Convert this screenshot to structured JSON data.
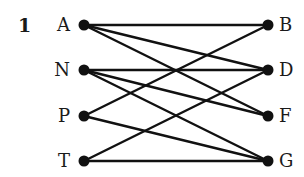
{
  "question_number": "1",
  "colors": {
    "ink": "#111111",
    "background": "#ffffff"
  },
  "left_nodes": [
    {
      "id": "A",
      "label": "A",
      "x": 84,
      "y": 25
    },
    {
      "id": "N",
      "label": "N",
      "x": 84,
      "y": 70
    },
    {
      "id": "P",
      "label": "P",
      "x": 84,
      "y": 116
    },
    {
      "id": "T",
      "label": "T",
      "x": 84,
      "y": 161
    }
  ],
  "right_nodes": [
    {
      "id": "B",
      "label": "B",
      "x": 268,
      "y": 25
    },
    {
      "id": "D",
      "label": "D",
      "x": 268,
      "y": 70
    },
    {
      "id": "F",
      "label": "F",
      "x": 268,
      "y": 116
    },
    {
      "id": "G",
      "label": "G",
      "x": 268,
      "y": 161
    }
  ],
  "edges": [
    [
      "A",
      "B"
    ],
    [
      "A",
      "D"
    ],
    [
      "A",
      "F"
    ],
    [
      "N",
      "D"
    ],
    [
      "N",
      "F"
    ],
    [
      "N",
      "G"
    ],
    [
      "P",
      "B"
    ],
    [
      "P",
      "G"
    ],
    [
      "T",
      "D"
    ],
    [
      "T",
      "G"
    ]
  ]
}
